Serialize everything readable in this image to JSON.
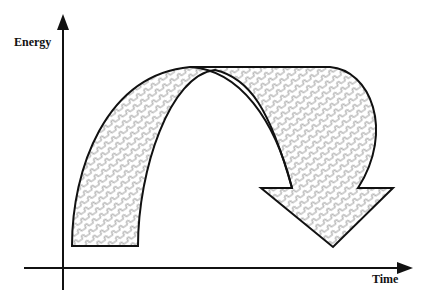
{
  "diagram": {
    "type": "energy-time curved arrow",
    "y_axis": {
      "label": "Energy"
    },
    "x_axis": {
      "label": "Time"
    },
    "arrow": {
      "shape": "curved arch arrow rising then falling",
      "fill_pattern": "zigzag-hatch",
      "stroke_color": "#111111",
      "pattern_color": "#8a8a8a"
    }
  }
}
